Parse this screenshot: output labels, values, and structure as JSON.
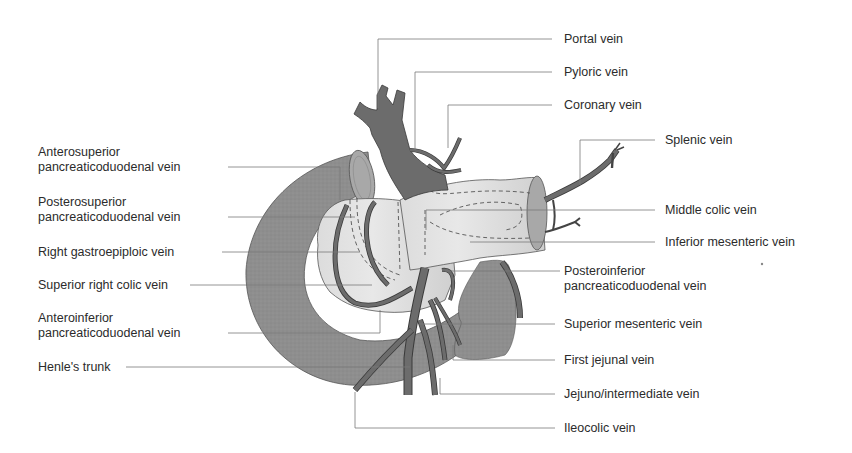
{
  "diagram": {
    "colors": {
      "background": "#ffffff",
      "duodenum": "#8e8e8e",
      "pancreas": "#d4d4d4",
      "pancreas_light": "#e6e6e6",
      "vein": "#6c6c6c",
      "vein_outline": "#3a3a3a",
      "leader_line": "#7a7a7a",
      "text": "#2b2b2b"
    },
    "labels_left": [
      {
        "id": "anterosuperior-pd",
        "lines": [
          "Anterosuperior",
          "pancreaticoduodenal vein"
        ]
      },
      {
        "id": "posterosuperior-pd",
        "lines": [
          "Posterosuperior",
          "pancreaticoduodenal vein"
        ]
      },
      {
        "id": "right-gastroepiploic",
        "lines": [
          "Right gastroepiploic vein"
        ]
      },
      {
        "id": "superior-right-colic",
        "lines": [
          "Superior right colic vein"
        ]
      },
      {
        "id": "anteroinferior-pd",
        "lines": [
          "Anteroinferior",
          "pancreaticoduodenal vein"
        ]
      },
      {
        "id": "henles-trunk",
        "lines": [
          "Henle's trunk"
        ]
      }
    ],
    "labels_right": [
      {
        "id": "portal",
        "lines": [
          "Portal vein"
        ]
      },
      {
        "id": "pyloric",
        "lines": [
          "Pyloric vein"
        ]
      },
      {
        "id": "coronary",
        "lines": [
          "Coronary vein"
        ]
      },
      {
        "id": "splenic",
        "lines": [
          "Splenic vein"
        ]
      },
      {
        "id": "middle-colic",
        "lines": [
          "Middle colic vein"
        ]
      },
      {
        "id": "inferior-mesenteric",
        "lines": [
          "Inferior mesenteric vein"
        ]
      },
      {
        "id": "posteroinferior-pd",
        "lines": [
          "Posteroinferior",
          "pancreaticoduodenal vein"
        ]
      },
      {
        "id": "superior-mesenteric",
        "lines": [
          "Superior mesenteric vein"
        ]
      },
      {
        "id": "first-jejunal",
        "lines": [
          "First jejunal vein"
        ]
      },
      {
        "id": "jejuno-intermediate",
        "lines": [
          "Jejuno/intermediate vein"
        ]
      },
      {
        "id": "ileocolic",
        "lines": [
          "Ileocolic vein"
        ]
      }
    ]
  }
}
